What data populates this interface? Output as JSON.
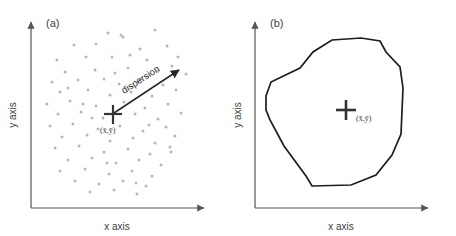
{
  "figure": {
    "background": "#ffffff",
    "panels": [
      {
        "id": "a",
        "label": "(a)",
        "x_axis_label": "x axis",
        "y_axis_label": "y axis",
        "centroid_label": "(x̄,ȳ)",
        "annotation_label": "dispersion",
        "point_color": "#b8b8b8",
        "axis_color": "#555555",
        "marker_color": "#333333"
      },
      {
        "id": "b",
        "label": "(b)",
        "x_axis_label": "x axis",
        "y_axis_label": "y axis",
        "centroid_label": "(x̄,ȳ)",
        "hull_color": "#1d1d1d",
        "axis_color": "#555555",
        "marker_color": "#333333"
      }
    ]
  },
  "chart_data": [
    {
      "type": "scatter",
      "title": "(a)",
      "xlabel": "x axis",
      "ylabel": "y axis",
      "xlim": [
        0,
        228
      ],
      "ylim": [
        0,
        236
      ],
      "grid": false,
      "legend": "none",
      "centroid": {
        "x": 112,
        "y": 116,
        "label": "(x̄,ȳ)"
      },
      "annotations": [
        {
          "text": "dispersion",
          "type": "arrow",
          "x1": 113,
          "y1": 114,
          "x2": 180,
          "y2": 68,
          "rotation": -35
        }
      ],
      "points": [
        [
          108,
          33
        ],
        [
          121,
          35
        ],
        [
          123,
          37
        ],
        [
          155,
          30
        ],
        [
          74,
          45
        ],
        [
          96,
          44
        ],
        [
          140,
          49
        ],
        [
          167,
          46
        ],
        [
          57,
          60
        ],
        [
          86,
          57
        ],
        [
          112,
          57
        ],
        [
          130,
          55
        ],
        [
          147,
          60
        ],
        [
          178,
          57
        ],
        [
          65,
          72
        ],
        [
          95,
          70
        ],
        [
          128,
          68
        ],
        [
          158,
          71
        ],
        [
          172,
          66
        ],
        [
          186,
          74
        ],
        [
          52,
          82
        ],
        [
          78,
          80
        ],
        [
          104,
          79
        ],
        [
          119,
          84
        ],
        [
          140,
          80
        ],
        [
          163,
          85
        ],
        [
          60,
          92
        ],
        [
          88,
          90
        ],
        [
          110,
          95
        ],
        [
          131,
          92
        ],
        [
          152,
          96
        ],
        [
          176,
          90
        ],
        [
          47,
          104
        ],
        [
          70,
          101
        ],
        [
          96,
          106
        ],
        [
          124,
          102
        ],
        [
          145,
          108
        ],
        [
          168,
          104
        ],
        [
          58,
          114
        ],
        [
          81,
          112
        ],
        [
          103,
          118
        ],
        [
          135,
          114
        ],
        [
          158,
          119
        ],
        [
          181,
          113
        ],
        [
          50,
          126
        ],
        [
          73,
          124
        ],
        [
          98,
          129
        ],
        [
          120,
          126
        ],
        [
          143,
          131
        ],
        [
          166,
          127
        ],
        [
          62,
          137
        ],
        [
          87,
          135
        ],
        [
          110,
          141
        ],
        [
          133,
          138
        ],
        [
          155,
          143
        ],
        [
          175,
          136
        ],
        [
          55,
          148
        ],
        [
          79,
          146
        ],
        [
          104,
          152
        ],
        [
          128,
          149
        ],
        [
          150,
          154
        ],
        [
          170,
          147
        ],
        [
          68,
          160
        ],
        [
          92,
          158
        ],
        [
          116,
          163
        ],
        [
          139,
          160
        ],
        [
          161,
          165
        ],
        [
          60,
          171
        ],
        [
          85,
          169
        ],
        [
          109,
          174
        ],
        [
          132,
          171
        ],
        [
          152,
          176
        ],
        [
          75,
          181
        ],
        [
          99,
          184
        ],
        [
          123,
          181
        ],
        [
          146,
          186
        ],
        [
          90,
          192
        ],
        [
          114,
          190
        ],
        [
          137,
          194
        ],
        [
          68,
          88
        ],
        [
          115,
          73
        ],
        [
          149,
          125
        ],
        [
          92,
          118
        ],
        [
          171,
          152
        ],
        [
          83,
          104
        ],
        [
          136,
          183
        ],
        [
          107,
          163
        ]
      ]
    },
    {
      "type": "polygon",
      "title": "(b)",
      "xlabel": "x axis",
      "ylabel": "y axis",
      "xlim": [
        0,
        228
      ],
      "ylim": [
        0,
        236
      ],
      "grid": false,
      "legend": "none",
      "centroid": {
        "x": 118,
        "y": 112,
        "label": "(x̄,ȳ)"
      },
      "vertices": [
        [
          38,
          96
        ],
        [
          43,
          82
        ],
        [
          72,
          68
        ],
        [
          85,
          52
        ],
        [
          104,
          40
        ],
        [
          133,
          38
        ],
        [
          152,
          41
        ],
        [
          158,
          52
        ],
        [
          172,
          67
        ],
        [
          175,
          88
        ],
        [
          173,
          134
        ],
        [
          164,
          155
        ],
        [
          148,
          175
        ],
        [
          123,
          185
        ],
        [
          84,
          186
        ],
        [
          78,
          176
        ],
        [
          56,
          146
        ],
        [
          42,
          120
        ],
        [
          38,
          110
        ]
      ]
    }
  ]
}
